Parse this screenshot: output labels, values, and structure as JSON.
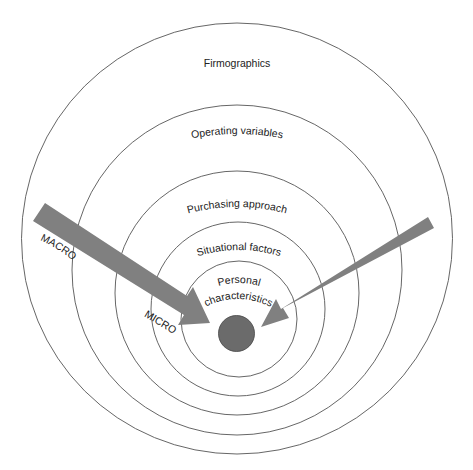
{
  "diagram": {
    "type": "nested-circles",
    "rings": [
      {
        "label": "Firmographics"
      },
      {
        "label": "Operating variables"
      },
      {
        "label": "Purchasing approach"
      },
      {
        "label": "Situational factors"
      },
      {
        "label_line1": "Personal",
        "label_line2": "characteristics"
      }
    ],
    "arrows": [
      {
        "label": "MACRO",
        "direction": "inward-from-left"
      },
      {
        "label": "MICRO",
        "direction": "inward-from-left"
      }
    ],
    "colors": {
      "arrow": "#808080",
      "center_dot": "#6b6b6b",
      "ring_stroke": "#555555"
    }
  }
}
